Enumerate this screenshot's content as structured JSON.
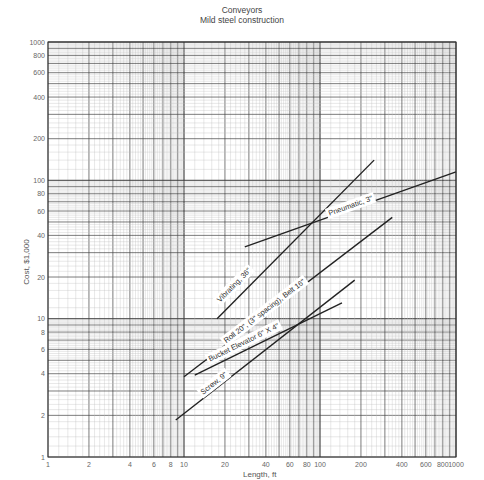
{
  "chart_data": {
    "type": "line",
    "title": "Conveyors",
    "subtitle": "Mild steel construction",
    "xlabel": "Length, ft",
    "ylabel": "Cost, $1,000",
    "xscale": "log",
    "yscale": "log",
    "xlim": [
      1,
      1000
    ],
    "ylim": [
      1,
      1000
    ],
    "grid": true,
    "x_ticks": [
      1,
      2,
      4,
      6,
      8,
      10,
      20,
      40,
      60,
      80,
      100,
      200,
      400,
      600,
      800,
      1000
    ],
    "x_tick_labels": [
      "1",
      "2",
      "4",
      "6",
      "8",
      "10",
      "20",
      "40",
      "60",
      "80",
      "100",
      "200",
      "400",
      "600",
      "800",
      "1000"
    ],
    "y_ticks": [
      1,
      2,
      4,
      6,
      8,
      10,
      20,
      40,
      60,
      80,
      100,
      200,
      400,
      600,
      800,
      1000
    ],
    "y_tick_labels": [
      "1",
      "2",
      "4",
      "6",
      "8",
      "10",
      "20",
      "40",
      "60",
      "80",
      "100",
      "200",
      "400",
      "600",
      "800",
      "1000"
    ],
    "legend": "inline labels along lines",
    "series": [
      {
        "name": "Vibrating, 36\"",
        "x": [
          17.5,
          250
        ],
        "y": [
          10,
          140
        ]
      },
      {
        "name": "Pneumatic, 3\"",
        "x": [
          28,
          1000
        ],
        "y": [
          33,
          115
        ]
      },
      {
        "name": "Roll 20\", (3\" spacing), Belt 16\"",
        "x": [
          10,
          340
        ],
        "y": [
          3.8,
          54
        ]
      },
      {
        "name": "Bucket Elevator 6\" X 4\"",
        "x": [
          12,
          145
        ],
        "y": [
          3.9,
          13
        ]
      },
      {
        "name": "Screw, 9\"",
        "x": [
          8.7,
          180
        ],
        "y": [
          1.85,
          19
        ]
      }
    ],
    "annotations": [
      {
        "text": "Vibrating, 36\"",
        "x": 24,
        "y": 17
      },
      {
        "text": "Pneumatic, 3\"",
        "x": 170,
        "y": 63
      },
      {
        "text": "Roll 20\", (3\" spacing), Belt 16\"",
        "x": 40,
        "y": 11
      },
      {
        "text": "Bucket Elevator 6\" X 4\"",
        "x": 28,
        "y": 6.5
      },
      {
        "text": "Screw, 9\"",
        "x": 17,
        "y": 3.3
      }
    ]
  }
}
